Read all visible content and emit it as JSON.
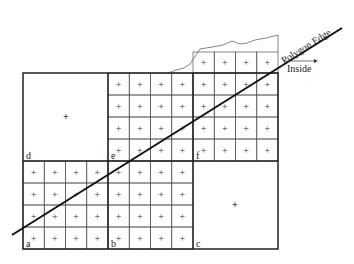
{
  "diagram": {
    "edge_label": "Polygon Edge",
    "inside_label": "Inside",
    "quadrant_labels": [
      "a",
      "b",
      "c",
      "d",
      "e",
      "f"
    ],
    "colors": {
      "line": "#111111",
      "grid": "#444444"
    }
  }
}
